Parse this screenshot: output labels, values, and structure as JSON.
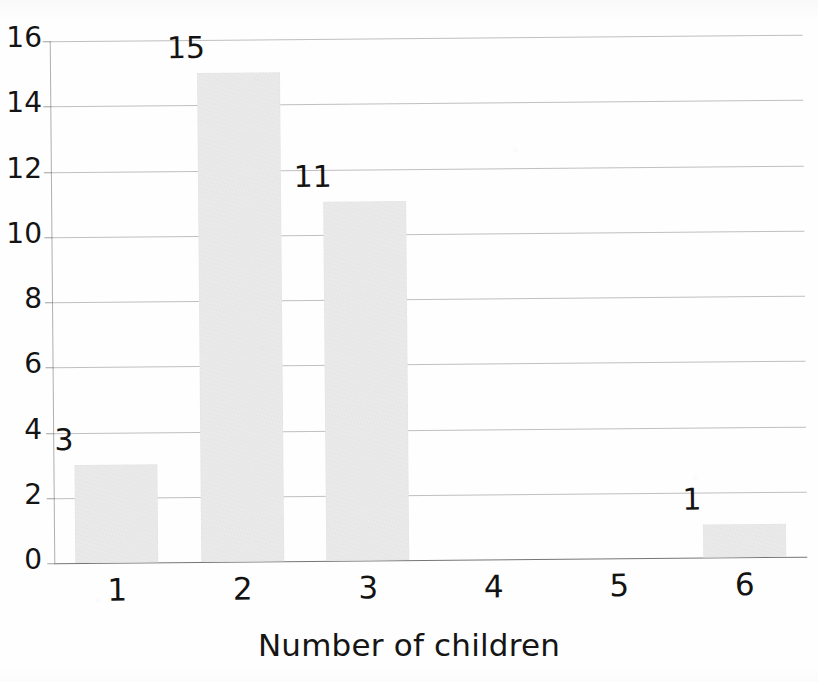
{
  "chart_data": {
    "type": "bar",
    "title": "",
    "title_fragment_cropped": "(cut off at top edge)",
    "categories": [
      "1",
      "2",
      "3",
      "4",
      "5",
      "6"
    ],
    "values": [
      3,
      15,
      11,
      0,
      0,
      1
    ],
    "data_labels": [
      "3",
      "15",
      "11",
      "",
      "",
      "1"
    ],
    "xlabel": "Number of children",
    "ylabel": "",
    "ylim": [
      0,
      16
    ],
    "y_ticks": [
      0,
      2,
      4,
      6,
      8,
      10,
      12,
      14,
      16
    ],
    "y_tick_labels": [
      "0",
      "2",
      "4",
      "6",
      "8",
      "10",
      "12",
      "14",
      "16"
    ],
    "grid": true,
    "grid_axis": "y",
    "legend": false,
    "bar_color": "#eaeaea",
    "gridline_color": "#9a9a9a",
    "text_color": "#131313",
    "background_color": "#ffffff"
  },
  "axes": {
    "y_tick_labels": [
      "16",
      "14",
      "12",
      "10",
      "8",
      "6",
      "4",
      "2",
      "0"
    ],
    "x_tick_labels": [
      "1",
      "2",
      "3",
      "4",
      "5",
      "6"
    ],
    "x_title": "Number of children"
  },
  "bars": [
    {
      "category": "1",
      "value": 3,
      "label": "3"
    },
    {
      "category": "2",
      "value": 15,
      "label": "15"
    },
    {
      "category": "3",
      "value": 11,
      "label": "11"
    },
    {
      "category": "4",
      "value": 0,
      "label": ""
    },
    {
      "category": "5",
      "value": 0,
      "label": ""
    },
    {
      "category": "6",
      "value": 1,
      "label": "1"
    }
  ],
  "header": {
    "title_fragment": ""
  }
}
